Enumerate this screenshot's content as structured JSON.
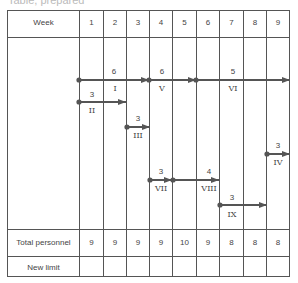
{
  "title_partial": "Table, prepared",
  "header": {
    "label": "Week",
    "weeks": [
      "1",
      "2",
      "3",
      "4",
      "5",
      "6",
      "7",
      "8",
      "9"
    ]
  },
  "activities": [
    {
      "id": "I",
      "duration": "6",
      "start_week": 1,
      "end_week": 3
    },
    {
      "id": "II",
      "duration": "3",
      "start_week": 1,
      "end_week": 2
    },
    {
      "id": "III",
      "duration": "3",
      "start_week": 3,
      "end_week": 3
    },
    {
      "id": "V",
      "duration": "6",
      "start_week": 4,
      "end_week": 5
    },
    {
      "id": "VI",
      "duration": "5",
      "start_week": 6,
      "end_week": 9
    },
    {
      "id": "IV",
      "duration": "3",
      "start_week": 9,
      "end_week": 9
    },
    {
      "id": "VII",
      "duration": "3",
      "start_week": 4,
      "end_week": 4
    },
    {
      "id": "VIII",
      "duration": "4",
      "start_week": 5,
      "end_week": 6
    },
    {
      "id": "IX",
      "duration": "3",
      "start_week": 7,
      "end_week": 8
    }
  ],
  "rows": {
    "total_label": "Total personnel",
    "total_values": [
      "9",
      "9",
      "9",
      "9",
      "10",
      "9",
      "8",
      "8",
      "8"
    ],
    "limit_label": "New limit",
    "limit_values": [
      "",
      "",
      "",
      "",
      "",
      "",
      "",
      "",
      ""
    ]
  }
}
